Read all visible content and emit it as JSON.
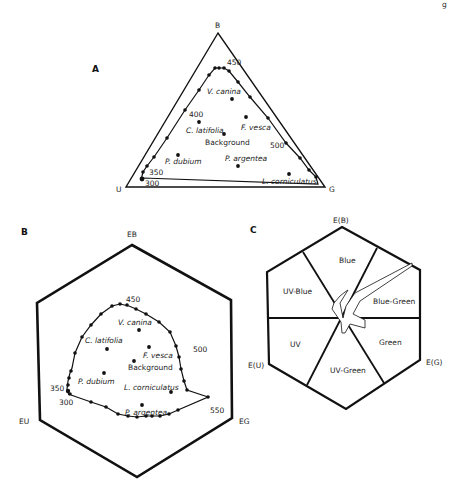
{
  "corner_fragment": "g",
  "panel_a": {
    "label": "A",
    "vertices": {
      "top": "B",
      "left": "U",
      "right": "G"
    },
    "wavelength_labels": [
      "450",
      "400",
      "500",
      "350",
      "300"
    ],
    "species": [
      "V. canina",
      "C. latifolia",
      "F. vesca",
      "Background",
      "P. dubium",
      "P. argentea",
      "L. corniculatus"
    ]
  },
  "panel_b": {
    "label": "B",
    "vertices": {
      "top": "EB",
      "left": "EU",
      "right": "EG"
    },
    "wavelength_labels": [
      "450",
      "500",
      "350",
      "300",
      "550"
    ],
    "species": [
      "V. canina",
      "C. latifolia",
      "F. vesca",
      "Background",
      "P. dubium",
      "L. corniculatus",
      "P. argentea"
    ]
  },
  "panel_c": {
    "label": "C",
    "vertices": {
      "top": "E(B)",
      "left": "E(U)",
      "right": "E(G)"
    },
    "sectors": [
      "Blue",
      "UV-Blue",
      "Blue-Green",
      "UV",
      "Green",
      "UV-Green"
    ]
  },
  "colors": {
    "line": "#111111",
    "background": "#ffffff"
  }
}
